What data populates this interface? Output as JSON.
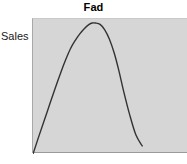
{
  "chart_data": {
    "type": "line",
    "title": "Fad",
    "xlabel": "",
    "ylabel": "Sales",
    "grid": false,
    "legend": null,
    "axis_ticks": {
      "x": [],
      "y": []
    },
    "xlim": [
      0,
      100
    ],
    "ylim": [
      0,
      100
    ],
    "series": [
      {
        "name": "Fad",
        "description": "Fad product life cycle: sales rise very steeply to a sharp peak then collapse almost as steeply",
        "x": [
          0,
          4,
          9,
          14,
          18,
          21,
          24,
          27,
          30,
          33,
          36,
          38,
          40,
          43,
          46,
          49,
          52,
          55,
          58,
          62,
          66,
          70
        ],
        "y": [
          0,
          14,
          31,
          48,
          61,
          70,
          78,
          84,
          89,
          93,
          96,
          97,
          97,
          96,
          92,
          85,
          75,
          62,
          47,
          29,
          14,
          6
        ]
      }
    ],
    "annotations": []
  },
  "figure": {
    "title": "Fad",
    "y_axis_label": "Sales"
  },
  "colors": {
    "background": "#ffffff",
    "plot_background": "#d6d6d6",
    "curve": "#333333",
    "axis_line": "#9a9a9a",
    "text": "#000000"
  }
}
